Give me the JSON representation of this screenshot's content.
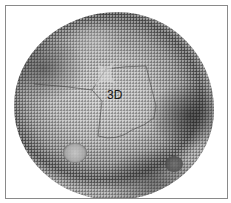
{
  "figure": {
    "type": "micrograph",
    "label": "3D",
    "border_color": "#8a8a8a",
    "background_color": "#ffffff"
  }
}
